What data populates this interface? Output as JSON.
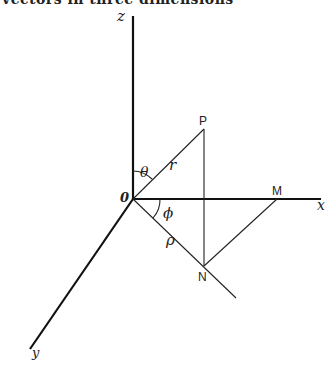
{
  "caption": "vectors in three dimensions",
  "diagram": {
    "axes": {
      "x": "x",
      "y": "y",
      "z": "z"
    },
    "origin_label": "0",
    "points": {
      "P": "P",
      "N": "N",
      "M": "M"
    },
    "symbols": {
      "theta": "θ",
      "phi": "ϕ",
      "r": "r",
      "rho": "ρ"
    },
    "colors": {
      "line": "#111111",
      "background": "#ffffff"
    }
  }
}
